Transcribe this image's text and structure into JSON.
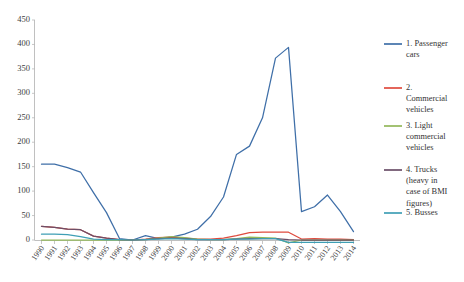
{
  "chart_data": {
    "type": "line",
    "title": "",
    "subtitle": "",
    "xlabel": "",
    "ylabel": "",
    "grid": false,
    "legend_position": "right",
    "ylim": [
      0,
      450
    ],
    "ytick_step": 50,
    "yticks": [
      0,
      50,
      100,
      150,
      200,
      250,
      300,
      350,
      400,
      450
    ],
    "categories": [
      "1990",
      "1991",
      "1992",
      "1993",
      "1994",
      "1995",
      "1996",
      "1997",
      "1998",
      "1999",
      "2000",
      "2001",
      "2002",
      "2003",
      "2004",
      "2005",
      "2006",
      "2007",
      "2008",
      "2009",
      "2010",
      "2011",
      "2012",
      "2013",
      "2014"
    ],
    "series": [
      {
        "name": "1. Passenger cars",
        "color": "#3f6fa8",
        "values": [
          155,
          155,
          148,
          139,
          97,
          56,
          3,
          0,
          9,
          3,
          6,
          12,
          22,
          48,
          88,
          175,
          192,
          250,
          372,
          394,
          58,
          68,
          92,
          58,
          17
        ]
      },
      {
        "name": "2. Commercial vehicles",
        "color": "#df4b3e",
        "values": [
          28,
          26,
          22,
          21,
          8,
          4,
          1,
          0,
          2,
          5,
          6,
          4,
          2,
          2,
          4,
          9,
          15,
          16,
          16,
          16,
          2,
          3,
          2,
          2,
          1
        ]
      },
      {
        "name": "3. Light commercial vehicles",
        "color": "#93b85a",
        "values": [
          0,
          0,
          0,
          0,
          0,
          0,
          0,
          0,
          1,
          4,
          7,
          5,
          2,
          1,
          1,
          3,
          6,
          5,
          4,
          -6,
          0,
          0,
          0,
          0,
          0
        ]
      },
      {
        "name": "4. Trucks (heavy in case of BMI figures)",
        "color": "#6b4f68",
        "values": [
          28,
          26,
          22,
          21,
          8,
          4,
          1,
          0,
          1,
          3,
          4,
          3,
          1,
          1,
          1,
          2,
          3,
          3,
          3,
          1,
          0,
          0,
          0,
          0,
          0
        ]
      },
      {
        "name": "5. Busses",
        "color": "#3f9fb5",
        "values": [
          12,
          12,
          11,
          7,
          2,
          1,
          1,
          0,
          1,
          2,
          3,
          2,
          1,
          1,
          1,
          2,
          2,
          3,
          3,
          -5,
          -5,
          -5,
          -5,
          -5,
          -5
        ]
      }
    ]
  },
  "legend": {
    "items": [
      {
        "label_lines": [
          "1. Passenger",
          "cars"
        ],
        "color": "#3f6fa8"
      },
      {
        "label_lines": [
          "2.",
          "Commercial",
          "vehicles"
        ],
        "color": "#df4b3e"
      },
      {
        "label_lines": [
          "3. Light",
          "commercial",
          "vehicles"
        ],
        "color": "#93b85a"
      },
      {
        "label_lines": [
          "4. Trucks",
          "(heavy in",
          "case of BMI",
          "figures)"
        ],
        "color": "#6b4f68"
      },
      {
        "label_lines": [
          "5. Busses"
        ],
        "color": "#3f9fb5"
      }
    ]
  }
}
